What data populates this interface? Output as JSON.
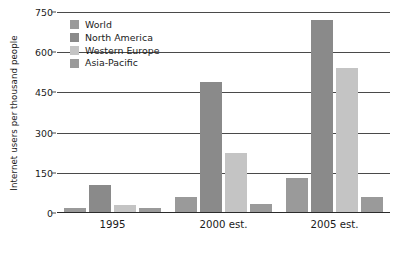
{
  "chart_data": {
    "type": "bar",
    "title": "",
    "subtitle": "",
    "xlabel": "",
    "ylabel": "Internet users per thousand people",
    "categories": [
      "1995",
      "2000 est.",
      "2005 est."
    ],
    "series": [
      {
        "name": "World",
        "color": "#9a9a9a",
        "values": [
          20,
          60,
          130
        ]
      },
      {
        "name": "North America",
        "color": "#8a8a8a",
        "values": [
          105,
          490,
          720
        ]
      },
      {
        "name": "Western Europe",
        "color": "#c4c4c4",
        "values": [
          30,
          225,
          540
        ]
      },
      {
        "name": "Asia-Pacific",
        "color": "#9a9a9a",
        "values": [
          18,
          35,
          60
        ]
      }
    ],
    "ylim": [
      0,
      750
    ],
    "yticks": [
      0,
      150,
      300,
      450,
      600,
      750
    ],
    "ytick_labels": [
      "0",
      "150",
      "300",
      "450",
      "600",
      "750"
    ],
    "grid": true,
    "legend_position": "top-left-inside",
    "orientation": "vertical",
    "grouped": true
  },
  "colors": {
    "background": "#ffffff",
    "gridline": "#4a4a4a",
    "axis": "#2b2b2b",
    "text": "#1a1a1a"
  }
}
